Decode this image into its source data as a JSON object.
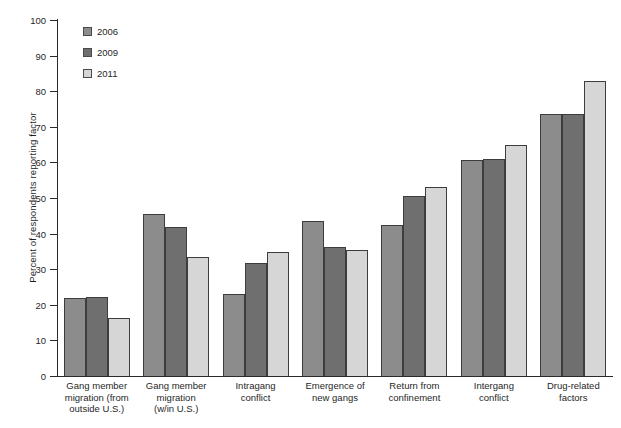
{
  "chart_data": {
    "type": "bar",
    "title": "",
    "xlabel": "",
    "ylabel": "Percent of respondents reporting factor",
    "ylim": [
      0,
      100
    ],
    "yticks": [
      0,
      10,
      20,
      30,
      40,
      50,
      60,
      70,
      80,
      90,
      100
    ],
    "grid": false,
    "legend_position": "top-left",
    "categories": [
      "Gang member migration (from outside U.S.)",
      "Gang member migration (w/in U.S.)",
      "Intragang conflict",
      "Emergence of new gangs",
      "Return from confinement",
      "Intergang conflict",
      "Drug-related factors"
    ],
    "series": [
      {
        "name": "2006",
        "color": "#8c8c8c",
        "values": [
          21.8,
          45.5,
          23.1,
          43.5,
          42.3,
          60.6,
          73.7
        ]
      },
      {
        "name": "2009",
        "color": "#6f6f6f",
        "values": [
          22.3,
          41.9,
          31.8,
          36.2,
          50.5,
          60.9,
          73.7
        ]
      },
      {
        "name": "2011",
        "color": "#d6d6d6",
        "values": [
          16.3,
          33.3,
          34.9,
          35.4,
          53.0,
          64.8,
          82.8
        ]
      }
    ]
  },
  "axis": {
    "y_title": "Percent of respondents reporting factor",
    "tick_labels": [
      "100",
      "90",
      "80",
      "70",
      "60",
      "50",
      "40",
      "30",
      "20",
      "10",
      "0"
    ]
  },
  "legend": {
    "items": [
      {
        "label": "2006",
        "color": "#8c8c8c"
      },
      {
        "label": "2009",
        "color": "#6f6f6f"
      },
      {
        "label": "2011",
        "color": "#d6d6d6"
      }
    ]
  },
  "x_axis_labels": [
    [
      "Gang member",
      "migration (from",
      "outside U.S.)"
    ],
    [
      "Gang member",
      "migration",
      "(w/in U.S.)"
    ],
    [
      "Intragang",
      "conflict"
    ],
    [
      "Emergence of",
      "new gangs"
    ],
    [
      "Return from",
      "confinement"
    ],
    [
      "Intergang",
      "conflict"
    ],
    [
      "Drug-related",
      "factors"
    ]
  ]
}
